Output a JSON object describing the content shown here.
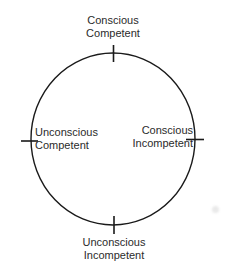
{
  "diagram": {
    "type": "cycle",
    "shape": "circle",
    "stroke_color": "#1a1a1a",
    "text_color": "#2b2b2b",
    "nodes": [
      {
        "id": "top",
        "position": "top",
        "line1": "Conscious",
        "line2": "Competent"
      },
      {
        "id": "right",
        "position": "right",
        "line1": "Conscious",
        "line2": "Incompetent"
      },
      {
        "id": "bottom",
        "position": "bottom",
        "line1": "Unconscious",
        "line2": "Incompetent"
      },
      {
        "id": "left",
        "position": "left",
        "line1": "Unconscious",
        "line2": "Competent"
      }
    ]
  }
}
